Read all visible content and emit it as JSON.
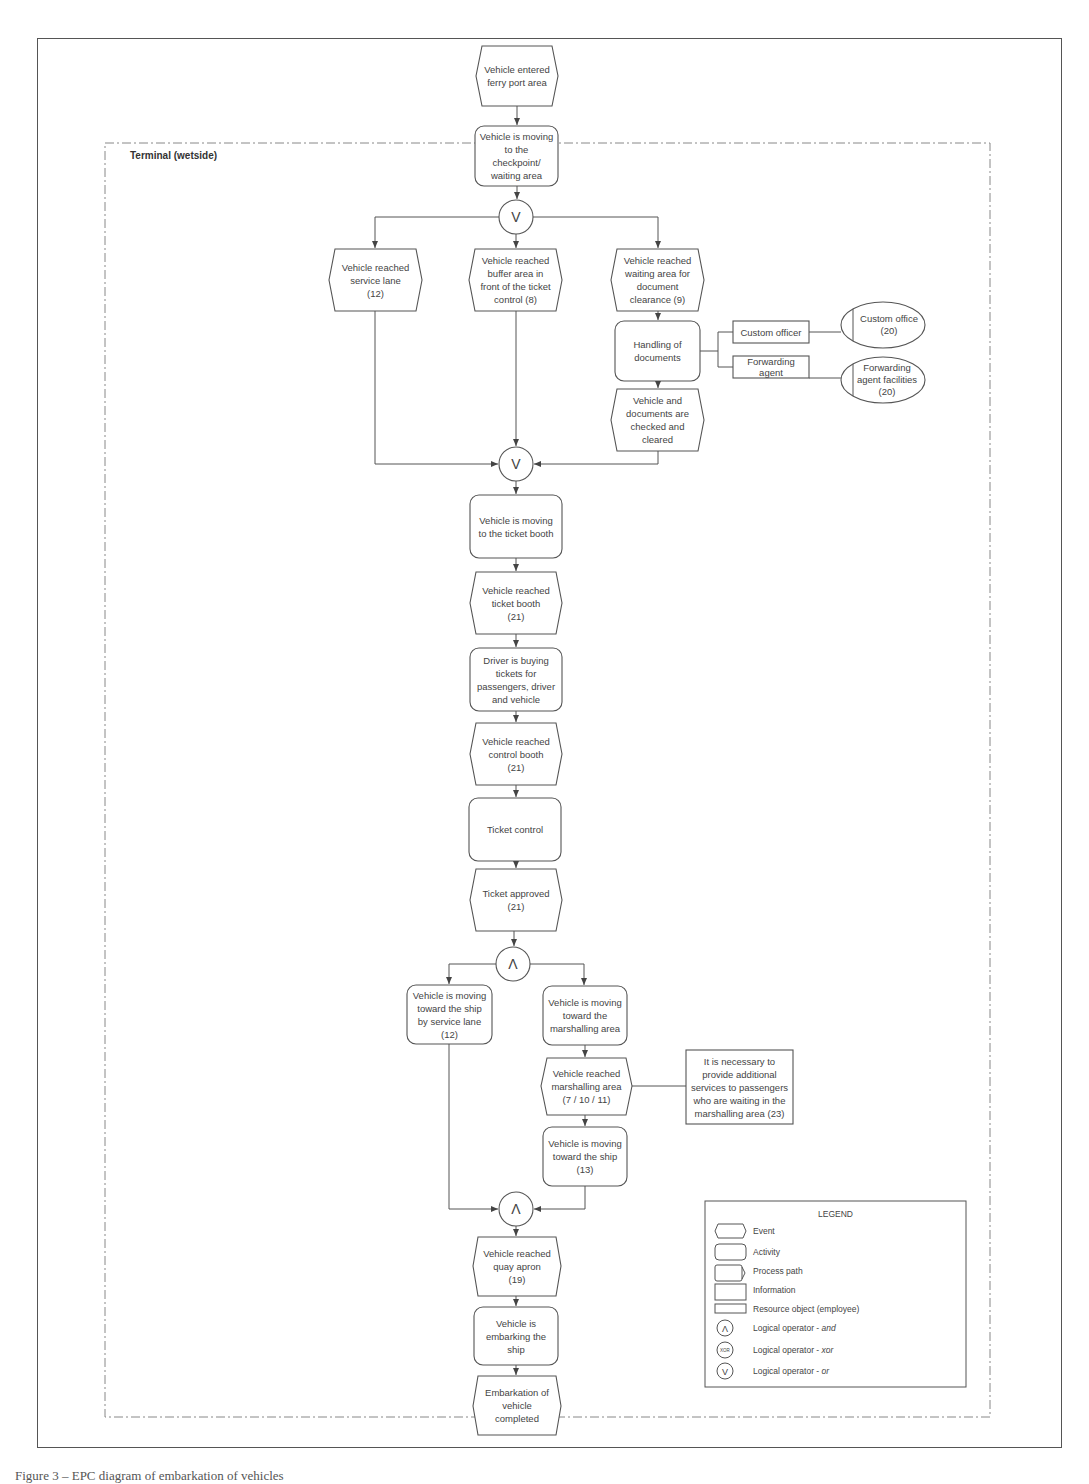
{
  "diagram": {
    "container_label": "Terminal (wetside)",
    "nodes": {
      "e_entered": "Vehicle entered\nferry port area",
      "a_moving_checkpoint": "Vehicle is moving\nto the\ncheckpoint/\nwaiting area",
      "e_service_lane": "Vehicle reached\nservice lane\n(12)",
      "e_buffer_area": "Vehicle reached\nbuffer area in\nfront of the ticket\ncontrol (8)",
      "e_waiting_doc": "Vehicle reached\nwaiting area for\ndocument\nclearance (9)",
      "a_handling_docs": "Handling of\ndocuments",
      "r_custom_officer": "Custom officer",
      "r_forwarding_agent": "Forwarding\nagent",
      "o_custom_office": "Custom office\n(20)",
      "o_forwarding_facilities": "Forwarding\nagent facilities\n(20)",
      "e_checked_cleared": "Vehicle and\ndocuments are\nchecked and\ncleared",
      "a_moving_ticket_booth": "Vehicle is moving\nto the ticket booth",
      "e_ticket_booth": "Vehicle reached\nticket booth\n(21)",
      "a_buying_tickets": "Driver is buying\ntickets for\npassengers, driver\nand vehicle",
      "e_control_booth": "Vehicle reached\ncontrol booth\n(21)",
      "a_ticket_control": "Ticket control",
      "e_ticket_approved": "Ticket approved\n(21)",
      "a_ship_service_lane": "Vehicle is moving\ntoward the ship\nby service lane\n(12)",
      "a_toward_marshalling": "Vehicle is moving\ntoward the\nmarshalling area",
      "e_marshalling": "Vehicle reached\nmarshalling area\n(7 / 10 / 11)",
      "i_additional_services": "It is necessary to\nprovide additional\nservices to passengers\nwho are waiting in the\nmarshalling area (23)",
      "a_toward_ship": "Vehicle is moving\ntoward the ship\n(13)",
      "e_quay_apron": "Vehicle reached\nquay apron\n(19)",
      "a_embarking": "Vehicle is\nembarking the\nship",
      "e_completed": "Embarkation of\nvehicle\ncompleted"
    },
    "operators": {
      "or_split": "V",
      "or_join": "V",
      "and_split": "Λ",
      "and_join": "Λ"
    }
  },
  "legend": {
    "title": "LEGEND",
    "items": [
      {
        "symbol": "event-icon",
        "label": "Event"
      },
      {
        "symbol": "activity-icon",
        "label": "Activity"
      },
      {
        "symbol": "process-path-icon",
        "label": "Process path"
      },
      {
        "symbol": "information-icon",
        "label": "Information"
      },
      {
        "symbol": "resource-object-icon",
        "label": "Resource object (employee)"
      },
      {
        "symbol": "and-operator-icon",
        "label": "Logical operator - ",
        "em": "and",
        "glyph": "Λ"
      },
      {
        "symbol": "xor-operator-icon",
        "label": "Logical operator - ",
        "em": "xor",
        "glyph": "XOR"
      },
      {
        "symbol": "or-operator-icon",
        "label": "Logical operator - ",
        "em": "or",
        "glyph": "V"
      }
    ]
  },
  "caption": "Figure 3 – EPC diagram of embarkation of vehicles"
}
